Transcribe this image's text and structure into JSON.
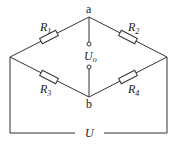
{
  "diagram": {
    "nodes": {
      "a": "a",
      "b": "b"
    },
    "resistors": [
      {
        "name": "R",
        "sub": "1"
      },
      {
        "name": "R",
        "sub": "2"
      },
      {
        "name": "R",
        "sub": "3"
      },
      {
        "name": "R",
        "sub": "4"
      }
    ],
    "output_voltage": {
      "name": "U",
      "sub": "o"
    },
    "supply_voltage": "U",
    "colors": {
      "line": "#333333",
      "background": "#ffffff"
    }
  }
}
